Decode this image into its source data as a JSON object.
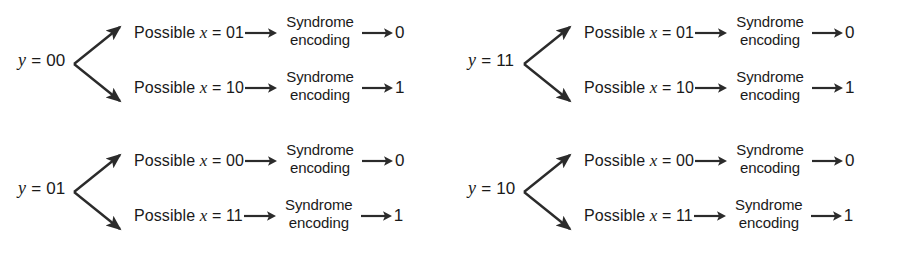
{
  "diagram": {
    "stroke_color": "#2b2b2b",
    "text_color": "#1a1a1a",
    "background_color": "#ffffff",
    "stage_label_line1": "Syndrome",
    "stage_label_line2": "encoding",
    "blocks": [
      {
        "id": "block-y-00",
        "position": "top-left",
        "source_label": "y = 00",
        "source_var": "y",
        "source_value": "= 00",
        "branches": [
          {
            "id": "branch-y00-x01",
            "candidate_label": "Possible x = 01",
            "candidate_prefix": "Possible",
            "candidate_var": "x",
            "candidate_value": "= 01",
            "stage_line1": "Syndrome",
            "stage_line2": "encoding",
            "output": "0"
          },
          {
            "id": "branch-y00-x10",
            "candidate_label": "Possible x = 10",
            "candidate_prefix": "Possible",
            "candidate_var": "x",
            "candidate_value": "= 10",
            "stage_line1": "Syndrome",
            "stage_line2": "encoding",
            "output": "1"
          }
        ]
      },
      {
        "id": "block-y-11",
        "position": "top-right",
        "source_label": "y = 11",
        "source_var": "y",
        "source_value": "= 11",
        "branches": [
          {
            "id": "branch-y11-x01",
            "candidate_label": "Possible x = 01",
            "candidate_prefix": "Possible",
            "candidate_var": "x",
            "candidate_value": "= 01",
            "stage_line1": "Syndrome",
            "stage_line2": "encoding",
            "output": "0"
          },
          {
            "id": "branch-y11-x10",
            "candidate_label": "Possible x = 10",
            "candidate_prefix": "Possible",
            "candidate_var": "x",
            "candidate_value": "= 10",
            "stage_line1": "Syndrome",
            "stage_line2": "encoding",
            "output": "1"
          }
        ]
      },
      {
        "id": "block-y-01",
        "position": "bottom-left",
        "source_label": "y = 01",
        "source_var": "y",
        "source_value": "= 01",
        "branches": [
          {
            "id": "branch-y01-x00",
            "candidate_label": "Possible x = 00",
            "candidate_prefix": "Possible",
            "candidate_var": "x",
            "candidate_value": "= 00",
            "stage_line1": "Syndrome",
            "stage_line2": "encoding",
            "output": "0"
          },
          {
            "id": "branch-y01-x11",
            "candidate_label": "Possible x = 11",
            "candidate_prefix": "Possible",
            "candidate_var": "x",
            "candidate_value": "= 11",
            "stage_line1": "Syndrome",
            "stage_line2": "encoding",
            "output": "1"
          }
        ]
      },
      {
        "id": "block-y-10",
        "position": "bottom-right",
        "source_label": "y = 10",
        "source_var": "y",
        "source_value": "= 10",
        "branches": [
          {
            "id": "branch-y10-x00",
            "candidate_label": "Possible x = 00",
            "candidate_prefix": "Possible",
            "candidate_var": "x",
            "candidate_value": "= 00",
            "stage_line1": "Syndrome",
            "stage_line2": "encoding",
            "output": "0"
          },
          {
            "id": "branch-y10-x11",
            "candidate_label": "Possible x = 11",
            "candidate_prefix": "Possible",
            "candidate_var": "x",
            "candidate_value": "= 11",
            "stage_line1": "Syndrome",
            "stage_line2": "encoding",
            "output": "1"
          }
        ]
      }
    ]
  }
}
